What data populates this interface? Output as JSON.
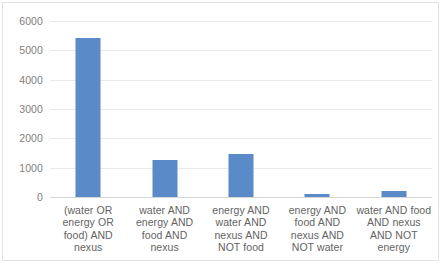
{
  "chart_data": {
    "type": "bar",
    "title": "",
    "xlabel": "",
    "ylabel": "",
    "ylim": [
      0,
      6000
    ],
    "grid": true,
    "legend": "none",
    "bar_color": "#5b8ac9",
    "categories": [
      "(water OR energy OR food) AND nexus",
      "water AND energy AND food AND nexus",
      "energy AND water AND nexus AND NOT food",
      "energy AND food AND nexus AND NOT water",
      "water AND food AND nexus AND NOT energy"
    ],
    "values": [
      5420,
      1260,
      1470,
      100,
      190
    ],
    "y_ticks": [
      "0",
      "1000",
      "2000",
      "3000",
      "4000",
      "5000",
      "6000"
    ],
    "y_tick_values": [
      0,
      1000,
      2000,
      3000,
      4000,
      5000,
      6000
    ]
  }
}
